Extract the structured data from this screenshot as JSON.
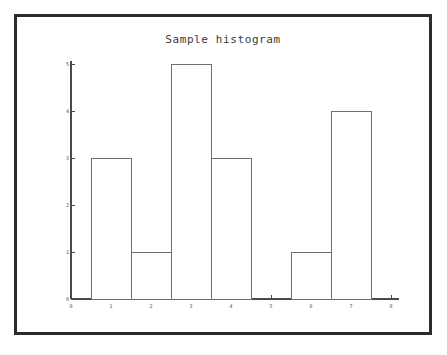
{
  "figure": {
    "title": "Sample histogram",
    "border_color": "#2b2b2b",
    "background_color": "#ffffff",
    "axis_color": "#4a4a4a",
    "bar_edge_color": "#707070",
    "bar_fill_color": "#ffffff"
  },
  "chart_data": {
    "type": "bar",
    "title": "Sample histogram",
    "xlabel": "",
    "ylabel": "",
    "categories": [
      "1",
      "2",
      "3",
      "4",
      "5",
      "6",
      "7",
      "8"
    ],
    "values": [
      3,
      1,
      5,
      3,
      0,
      1,
      4,
      0
    ],
    "bin_edges": [
      0.5,
      1.5,
      2.5,
      3.5,
      4.5,
      5.5,
      6.5,
      7.5,
      8.5
    ],
    "xlim": [
      0,
      8
    ],
    "ylim": [
      0,
      5
    ],
    "xticks": [
      "0",
      "1",
      "2",
      "3",
      "4",
      "5",
      "6",
      "7",
      "8"
    ],
    "xtick_values": [
      0,
      1,
      2,
      3,
      4,
      5,
      6,
      7,
      8
    ],
    "yticks": [
      "0",
      "1",
      "2",
      "3",
      "4",
      "5"
    ],
    "ytick_values": [
      0,
      1,
      2,
      3,
      4,
      5
    ],
    "grid": false,
    "legend": null,
    "bar_style": "outline"
  }
}
